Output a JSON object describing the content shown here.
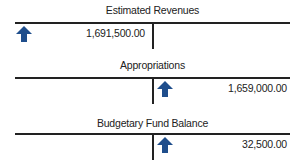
{
  "accounts": [
    {
      "title": "Estimated Revenues",
      "side": "debit",
      "direction": "increase",
      "icon": "up-arrow-icon",
      "amount": "1,691,500.00"
    },
    {
      "title": "Appropriations",
      "side": "credit",
      "direction": "increase",
      "icon": "up-arrow-icon",
      "amount": "1,659,000.00"
    },
    {
      "title": "Budgetary Fund Balance",
      "side": "credit",
      "direction": "increase",
      "icon": "up-arrow-icon",
      "amount": "32,500.00"
    }
  ],
  "colors": {
    "arrow": "#1f4e8c",
    "line": "#222222",
    "text": "#222222"
  }
}
